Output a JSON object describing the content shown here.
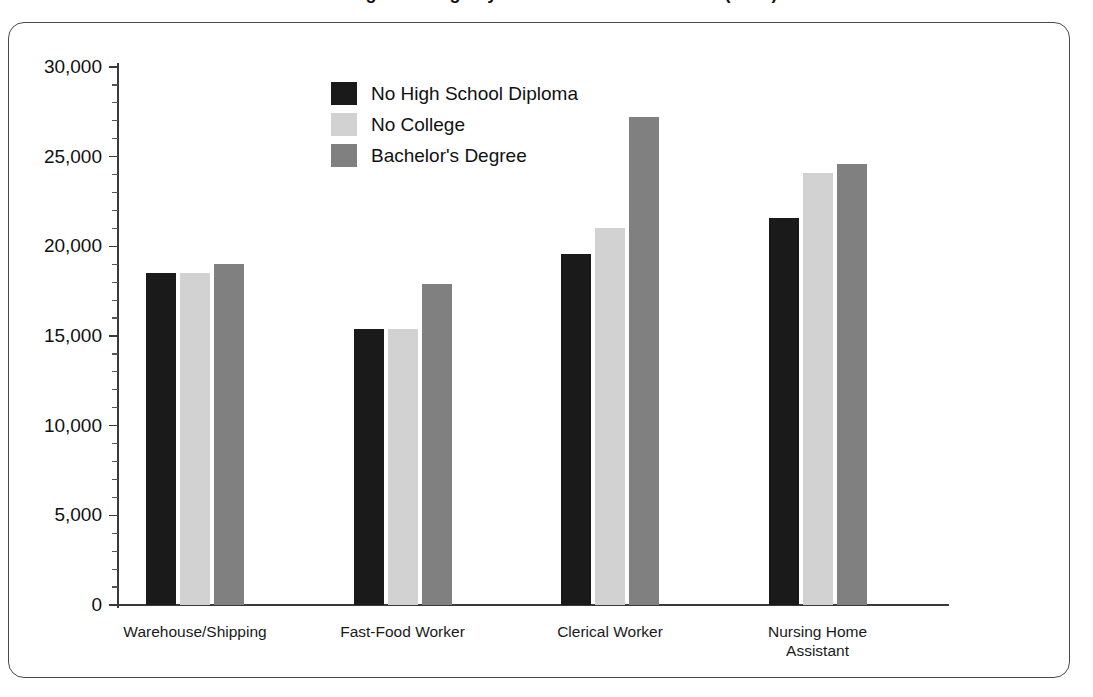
{
  "chart_data": {
    "type": "bar",
    "title": "Average Earnings by Job and Education Level (2012)",
    "xlabel": "",
    "ylabel": "",
    "ylim": [
      0,
      30000
    ],
    "ytick_values": [
      0,
      5000,
      10000,
      15000,
      20000,
      25000,
      30000
    ],
    "ytick_labels": [
      "0",
      "5,000",
      "10,000",
      "15,000",
      "20,000",
      "25,000",
      "30,000"
    ],
    "minor_tick_step": 1000,
    "grid": false,
    "legend_position": "inside-upper-left",
    "categories": [
      "Warehouse/Shipping",
      "Fast-Food Worker",
      "Clerical Worker",
      "Nursing Home\nAssistant"
    ],
    "series": [
      {
        "name": "No High School Diploma",
        "color": "#1a1a1a",
        "values": [
          18500,
          15400,
          19600,
          21600
        ]
      },
      {
        "name": "No College",
        "color": "#d2d2d2",
        "values": [
          18500,
          15400,
          21000,
          24100
        ]
      },
      {
        "name": "Bachelor's Degree",
        "color": "#808080",
        "values": [
          19000,
          17900,
          27200,
          24600
        ]
      }
    ]
  },
  "frame": {
    "border_color": "#4a4a4a",
    "background": "#ffffff"
  },
  "axis": {
    "line_color": "#3a3a3a"
  }
}
